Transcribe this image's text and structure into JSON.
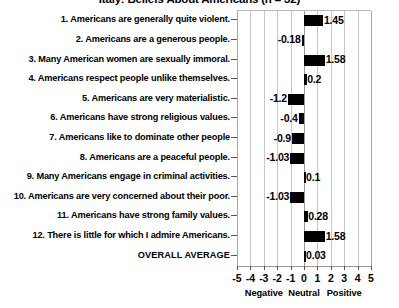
{
  "chart_data": {
    "type": "bar",
    "orientation": "horizontal",
    "title": "Italy: Beliefs About Americans (n = 32)",
    "xlabel": "",
    "ylabel": "",
    "xlim": [
      -5,
      5
    ],
    "grid": true,
    "legend": false,
    "xticks": [
      -5,
      -4,
      -3,
      -2,
      -1,
      0,
      1,
      2,
      3,
      4,
      5
    ],
    "xtick_labels": [
      "-5",
      "-4",
      "-3",
      "-2",
      "-1",
      "0",
      "1",
      "2",
      "3",
      "4",
      "5"
    ],
    "axis_bands": [
      {
        "label": "Negative",
        "center": -3
      },
      {
        "label": "Neutral",
        "center": 0
      },
      {
        "label": "Positive",
        "center": 3
      }
    ],
    "categories": [
      "1. Americans are generally quite violent.",
      "2. Americans are a generous people.",
      "3. Many American women are sexually immoral.",
      "4. Americans respect people unlike themselves.",
      "5. Americans are very materialistic.",
      "6. Americans have strong religious values.",
      "7. Americans like to dominate other people",
      "8. Americans are a peaceful people.",
      "9. Many Americans engage in criminal activities.",
      "10. Americans are very concerned about their poor.",
      "11. Americans have strong family values.",
      "12. There is little for which I admire Americans.",
      "OVERALL AVERAGE"
    ],
    "values": [
      1.45,
      -0.18,
      1.58,
      0.2,
      -1.2,
      -0.4,
      -0.9,
      -1.03,
      0.1,
      -1.03,
      0.28,
      1.58,
      0.03
    ],
    "value_labels": [
      "1.45",
      "-0.18",
      "1.58",
      "0.2",
      "-1.2",
      "-0.4",
      "-0.9",
      "-1.03",
      "0.1",
      "-1.03",
      "0.28",
      "1.58",
      "0.03"
    ],
    "bar_color": "#000000"
  }
}
